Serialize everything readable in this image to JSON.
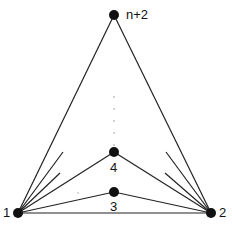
{
  "diagram": {
    "type": "graph",
    "nodes": [
      {
        "id": "1",
        "label": "1",
        "x": 18,
        "y": 213
      },
      {
        "id": "2",
        "label": "2",
        "x": 211,
        "y": 213
      },
      {
        "id": "3",
        "label": "3",
        "x": 114,
        "y": 192
      },
      {
        "id": "4",
        "label": "4",
        "x": 114,
        "y": 152
      },
      {
        "id": "n+2",
        "label": "n+2",
        "x": 114,
        "y": 15
      }
    ],
    "edges": [
      [
        "1",
        "2"
      ],
      [
        "1",
        "3"
      ],
      [
        "1",
        "4"
      ],
      [
        "1",
        "n+2"
      ],
      [
        "2",
        "3"
      ],
      [
        "2",
        "4"
      ],
      [
        "2",
        "n+2"
      ]
    ],
    "partial_edges": [
      {
        "from": "1",
        "to": [
          63,
          152
        ]
      },
      {
        "from": "1",
        "to": [
          60,
          173
        ]
      },
      {
        "from": "2",
        "to": [
          166,
          152
        ]
      },
      {
        "from": "2",
        "to": [
          165,
          173
        ]
      }
    ],
    "ellipsis_dots": [
      [
        114,
        97
      ],
      [
        114,
        109
      ],
      [
        114,
        121
      ],
      [
        114,
        133
      ],
      [
        114,
        145
      ]
    ],
    "stray_dot": [
      78,
      193
    ],
    "colors": {
      "node": "#111111",
      "edge": "#222222",
      "dots": "#999999"
    }
  }
}
